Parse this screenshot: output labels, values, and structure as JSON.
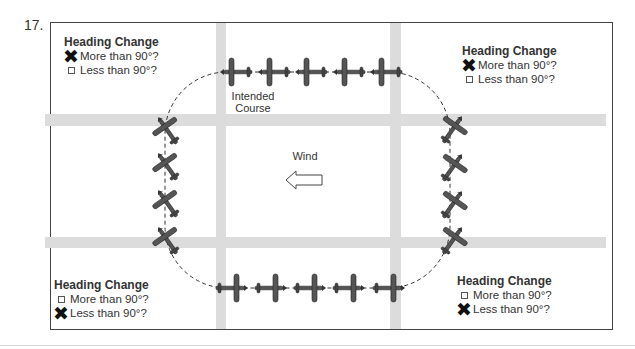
{
  "question_number": "17.",
  "wind": {
    "label": "Wind",
    "direction": "left"
  },
  "course": {
    "label_line1": "Intended",
    "label_line2": "Course"
  },
  "legends": {
    "top_left": {
      "title": "Heading Change",
      "options": [
        {
          "label": "More than 90°?",
          "checked": true
        },
        {
          "label": "Less than 90°?",
          "checked": false
        }
      ]
    },
    "top_right": {
      "title": "Heading Change",
      "options": [
        {
          "label": "More than 90°?",
          "checked": true
        },
        {
          "label": "Less than 90°?",
          "checked": false
        }
      ]
    },
    "bottom_left": {
      "title": "Heading Change",
      "options": [
        {
          "label": "More than 90°?",
          "checked": false
        },
        {
          "label": "Less than 90°?",
          "checked": true
        }
      ]
    },
    "bottom_right": {
      "title": "Heading Change",
      "options": [
        {
          "label": "More than 90°?",
          "checked": false
        },
        {
          "label": "Less than 90°?",
          "checked": true
        }
      ]
    }
  },
  "marks": {
    "checked": "✖",
    "unchecked": ""
  },
  "colors": {
    "road": "#dcdcdc",
    "plane": "#555555",
    "plane_outline": "#222222",
    "course": "#333333"
  }
}
